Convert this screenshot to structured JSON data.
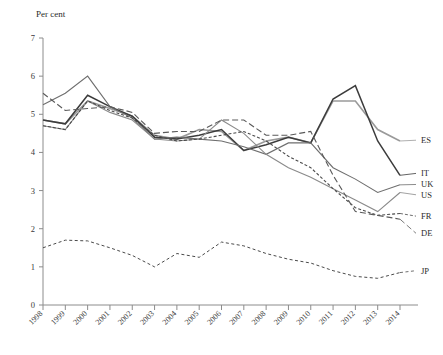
{
  "chart_data": {
    "type": "line",
    "title": "",
    "ylabel": "Per cent",
    "xlabel": "",
    "ylim": [
      0,
      7
    ],
    "yticks": [
      0,
      1,
      2,
      3,
      4,
      5,
      6,
      7
    ],
    "grid": false,
    "legend_position": "right-inline-labels",
    "x": [
      1998,
      1999,
      2000,
      2001,
      2002,
      2003,
      2004,
      2005,
      2006,
      2007,
      2008,
      2009,
      2010,
      2011,
      2012,
      2013,
      2014
    ],
    "categories": [
      "1998",
      "1999",
      "2000",
      "2001",
      "2002",
      "2003",
      "2004",
      "2005",
      "2006",
      "2007",
      "2008",
      "2009",
      "2010",
      "2011",
      "2012",
      "2013",
      "2014"
    ],
    "series": [
      {
        "name": "ES",
        "label": "ES",
        "color": "#9a9a9a",
        "width": 1.6,
        "dash": "none",
        "values": [
          4.85,
          4.75,
          5.35,
          5.15,
          4.95,
          4.45,
          4.35,
          4.6,
          4.55,
          4.05,
          4.3,
          4.4,
          4.25,
          5.35,
          5.35,
          4.6,
          4.3
        ]
      },
      {
        "name": "IT",
        "label": "IT",
        "color": "#3c3c3c",
        "width": 1.5,
        "dash": "none",
        "values": [
          4.85,
          4.75,
          5.5,
          5.2,
          4.95,
          4.4,
          4.35,
          4.45,
          4.6,
          4.05,
          4.2,
          4.4,
          4.25,
          5.4,
          5.75,
          4.3,
          3.4
        ]
      },
      {
        "name": "UK",
        "label": "UK",
        "color": "#6e6e6e",
        "width": 1.1,
        "dash": "none",
        "values": [
          5.25,
          5.55,
          6.0,
          5.2,
          4.9,
          4.35,
          4.4,
          4.35,
          4.3,
          4.15,
          3.95,
          4.25,
          4.25,
          3.6,
          3.3,
          2.95,
          3.15
        ]
      },
      {
        "name": "US",
        "label": "US",
        "color": "#8a8a8a",
        "width": 1.1,
        "dash": "none",
        "values": [
          4.7,
          4.6,
          5.35,
          5.05,
          4.85,
          4.35,
          4.3,
          4.35,
          4.85,
          4.5,
          3.95,
          3.6,
          3.35,
          3.05,
          2.75,
          2.45,
          2.95
        ]
      },
      {
        "name": "FR",
        "label": "FR",
        "color": "#4a4a4a",
        "width": 1.1,
        "dash": "3,2",
        "values": [
          4.7,
          4.6,
          5.35,
          5.1,
          4.9,
          4.45,
          4.3,
          4.35,
          4.45,
          4.55,
          4.3,
          3.9,
          3.6,
          3.05,
          2.55,
          2.35,
          2.4
        ]
      },
      {
        "name": "DE",
        "label": "DE",
        "color": "#5a5a5a",
        "width": 1.1,
        "dash": "6,3",
        "values": [
          5.55,
          5.1,
          5.15,
          5.2,
          5.05,
          4.5,
          4.55,
          4.55,
          4.85,
          4.85,
          4.45,
          4.45,
          4.55,
          3.4,
          2.45,
          2.35,
          2.25
        ]
      },
      {
        "name": "JP",
        "label": "JP",
        "color": "#4a4a4a",
        "width": 1.0,
        "dash": "3,2.5",
        "values": [
          1.5,
          1.7,
          1.68,
          1.5,
          1.3,
          1.0,
          1.35,
          1.25,
          1.65,
          1.55,
          1.35,
          1.2,
          1.1,
          0.9,
          0.75,
          0.7,
          0.85
        ]
      }
    ],
    "label_targets": {
      "ES": 4.3,
      "IT": 3.4,
      "UK": 3.15,
      "US": 2.95,
      "FR": 2.4,
      "DE": 2.25,
      "JP": 0.85
    },
    "label_slots": {
      "ES": 4.32,
      "IT": 3.45,
      "UK": 3.16,
      "US": 2.89,
      "FR": 2.33,
      "DE": 1.88,
      "JP": 0.9
    }
  },
  "figure": {
    "caption": ""
  }
}
